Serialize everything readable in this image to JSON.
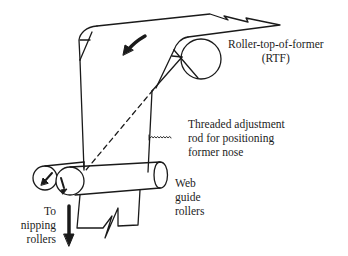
{
  "diagram": {
    "labels": {
      "rtf": [
        "Roller-top-of-former",
        "(RTF)"
      ],
      "rod": [
        "Threaded adjustment",
        "rod for positioning",
        "former nose"
      ],
      "web_guide": [
        "Web",
        "guide",
        "rollers"
      ],
      "nipping": [
        "To",
        "nipping",
        "rollers"
      ]
    },
    "components": [
      {
        "id": "web-sheet",
        "type": "paper web path"
      },
      {
        "id": "rtf-roller",
        "type": "roller",
        "label": "Roller-top-of-former (RTF)"
      },
      {
        "id": "former-board",
        "type": "triangular former"
      },
      {
        "id": "threaded-rod",
        "type": "adjustment rod"
      },
      {
        "id": "web-guide-roller-back",
        "type": "roller"
      },
      {
        "id": "web-guide-roller-front",
        "type": "roller"
      }
    ],
    "arrows": [
      {
        "id": "web-direction-arrow",
        "direction": "down-left"
      },
      {
        "id": "roller-back-rotation-arrow",
        "direction": "down-left"
      },
      {
        "id": "roller-front-rotation-arrow",
        "direction": "down"
      },
      {
        "id": "to-nipping-arrow",
        "direction": "down"
      }
    ],
    "colors": {
      "line": "#1a1a1a",
      "background": "#ffffff"
    }
  }
}
